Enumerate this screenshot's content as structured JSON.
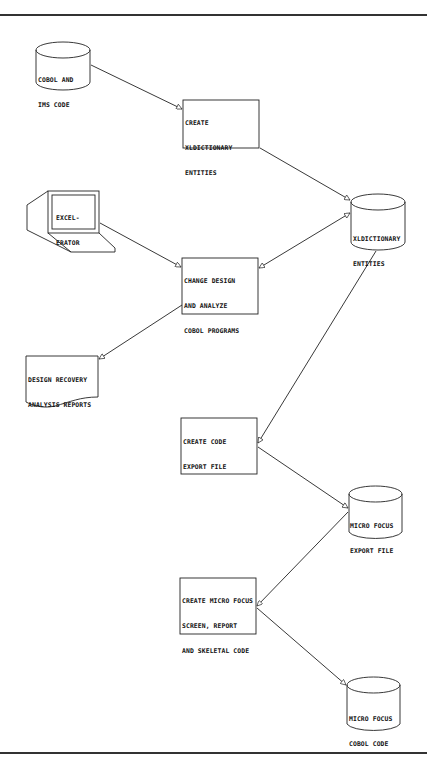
{
  "diagram": {
    "title": "",
    "nodes": [
      {
        "id": "cobol_ims",
        "shape": "cylinder",
        "lines": [
          "COBOL AND",
          "IMS CODE"
        ]
      },
      {
        "id": "create_xld",
        "shape": "process",
        "lines": [
          "CREATE",
          "XLDICTIONARY",
          "ENTITIES"
        ]
      },
      {
        "id": "xld_entities",
        "shape": "cylinder",
        "lines": [
          "XLDICTIONARY",
          "ENTITIES"
        ]
      },
      {
        "id": "excelerator",
        "shape": "terminal",
        "lines": [
          "EXCEL-",
          "ERATOR"
        ]
      },
      {
        "id": "change_design",
        "shape": "process",
        "lines": [
          "CHANGE DESIGN",
          "AND ANALYZE",
          "COBOL PROGRAMS"
        ]
      },
      {
        "id": "design_reports",
        "shape": "document",
        "lines": [
          "DESIGN RECOVERY",
          "ANALYSIS REPORTS"
        ]
      },
      {
        "id": "create_export",
        "shape": "process",
        "lines": [
          "CREATE CODE",
          "EXPORT FILE"
        ]
      },
      {
        "id": "mf_export",
        "shape": "cylinder",
        "lines": [
          "MICRO FOCUS",
          "EXPORT FILE"
        ]
      },
      {
        "id": "create_mf",
        "shape": "process",
        "lines": [
          "CREATE MICRO FOCUS",
          "SCREEN, REPORT",
          "AND SKELETAL CODE"
        ]
      },
      {
        "id": "mf_cobol",
        "shape": "cylinder",
        "lines": [
          "MICRO FOCUS",
          "COBOL CODE"
        ]
      }
    ],
    "edges": [
      {
        "from": "cobol_ims",
        "to": "create_xld",
        "direction": "forward"
      },
      {
        "from": "create_xld",
        "to": "xld_entities",
        "direction": "forward"
      },
      {
        "from": "excelerator",
        "to": "change_design",
        "direction": "forward"
      },
      {
        "from": "change_design",
        "to": "xld_entities",
        "direction": "both"
      },
      {
        "from": "change_design",
        "to": "design_reports",
        "direction": "forward"
      },
      {
        "from": "xld_entities",
        "to": "create_export",
        "direction": "forward"
      },
      {
        "from": "create_export",
        "to": "mf_export",
        "direction": "forward"
      },
      {
        "from": "mf_export",
        "to": "create_mf",
        "direction": "forward"
      },
      {
        "from": "create_mf",
        "to": "mf_cobol",
        "direction": "forward"
      }
    ]
  },
  "colors": {
    "line": "#222222",
    "background": "#ffffff"
  }
}
